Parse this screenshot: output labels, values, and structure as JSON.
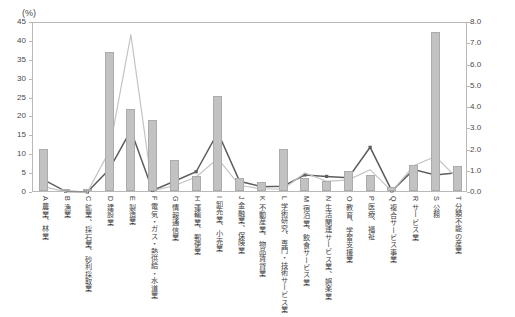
{
  "axes": {
    "left_unit": "(%)",
    "left_ticks": [
      "45",
      "40",
      "35",
      "30",
      "25",
      "20",
      "15",
      "10",
      "5",
      "0"
    ],
    "right_ticks": [
      "8.0",
      "7.0",
      "6.0",
      "5.0",
      "4.0",
      "3.0",
      "2.0",
      "1.0",
      "0.0"
    ]
  },
  "chart_data": {
    "type": "bar",
    "title": "",
    "xlabel": "",
    "ylabel": "(%)",
    "ylim": [
      0,
      45
    ],
    "y2lim": [
      0,
      8.0
    ],
    "grid": false,
    "legend": "none",
    "categories": [
      "A 農業、林業",
      "B 漁業",
      "C 鉱業、採石業、砂利採取業",
      "D 建設業",
      "E 製造業",
      "F 電気・ガス・熱供給・水道業",
      "G 情報通信業",
      "H 運輸業、郵便業",
      "I 卸売業、小売業",
      "J 金融業、保険業",
      "K 不動産業、物品賃貸業",
      "L 学術研究、専門・技術サービス業",
      "M 宿泊業、飲食サービス業",
      "N 生活関連サービス業、娯楽業",
      "O 教育、学習支援業",
      "P 医療、福祉",
      "Q 複合サービス事業",
      "R サービス業",
      "S 公務",
      "T 分類不能の産業"
    ],
    "category_codes": [
      "A",
      "B",
      "C",
      "D",
      "E",
      "F",
      "G",
      "H",
      "I",
      "J",
      "K",
      "L",
      "M",
      "N",
      "O",
      "P",
      "Q",
      "R",
      "S",
      "T"
    ],
    "category_names": [
      "農業、林業",
      "漁業",
      "鉱業、採石業、砂利採取業",
      "建設業",
      "製造業",
      "電気・ガス・熱供給・水道業",
      "情報通信業",
      "運輸業、郵便業",
      "卸売業、小売業",
      "金融業、保険業",
      "不動産業、物品賃貸業",
      "学術研究、専門・技術サービス業",
      "宿泊業、飲食サービス業",
      "生活関連サービス業、娯楽業",
      "教育、学習支援業",
      "医療、福祉",
      "複合サービス事業",
      "サービス業",
      "公務",
      "分類不能の産業"
    ],
    "series": [
      {
        "name": "bar-series",
        "kind": "bar",
        "axis": "left",
        "color": "#c2c2c2",
        "values": [
          11.1,
          0.4,
          0.3,
          36.8,
          21.6,
          18.8,
          8.1,
          3.9,
          25.2,
          3.4,
          2.4,
          11.2,
          3.5,
          2.7,
          5.4,
          4.2,
          1.0,
          6.8,
          42.0,
          6.5
        ]
      },
      {
        "name": "dark-line-series",
        "kind": "line",
        "axis": "right",
        "color": "#5d5d5d",
        "marker": "square",
        "values": [
          0.62,
          0.08,
          0.05,
          1.1,
          2.95,
          0.12,
          0.55,
          1.0,
          2.85,
          0.55,
          0.3,
          0.32,
          0.85,
          0.78,
          0.72,
          2.15,
          0.1,
          1.1,
          0.85,
          0.95
        ]
      },
      {
        "name": "light-line-series",
        "kind": "line",
        "axis": "right",
        "color": "#c4c4c4",
        "marker": "none",
        "values": [
          0.3,
          0.05,
          0.04,
          1.95,
          7.45,
          0.1,
          0.35,
          0.75,
          1.62,
          0.35,
          0.2,
          0.18,
          0.95,
          0.55,
          0.62,
          1.1,
          0.08,
          1.28,
          1.72,
          0.7
        ]
      }
    ]
  }
}
